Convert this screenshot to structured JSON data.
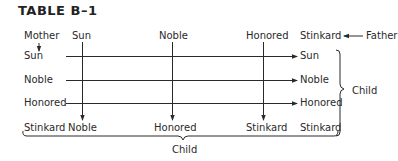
{
  "title": "TABLE B–1",
  "header": {
    "mother_label": "Mother",
    "father_label": "Father",
    "father_columns": [
      "Sun",
      "Noble",
      "Honored",
      "Stinkard"
    ]
  },
  "mother_rows": [
    "Sun",
    "Noble",
    "Honored",
    "Stinkard"
  ],
  "right_child_results": [
    "Sun",
    "Noble",
    "Honored",
    "Stinkard"
  ],
  "bottom_child_results": [
    "Noble",
    "Honored",
    "Stinkard",
    "Stinkard"
  ],
  "right_brace_label": "Child",
  "bottom_brace_label": "Child",
  "colors": {
    "ink": "#2a2a2a",
    "background": "#ffffff"
  }
}
